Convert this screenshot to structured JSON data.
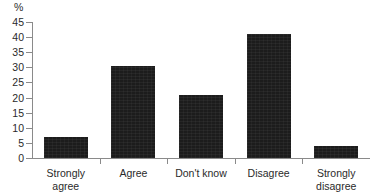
{
  "chart_data": {
    "type": "bar",
    "title": "",
    "xlabel": "",
    "ylabel": "%",
    "ylim": [
      0,
      45
    ],
    "ytick_step": 5,
    "grid": false,
    "legend": null,
    "bar_color": "#1c1c1c",
    "axis_color": "#8a8a8a",
    "categories": [
      "Strongly agree",
      "Agree",
      "Don't know",
      "Disagree",
      "Strongly disagree"
    ],
    "category_labels_wrapped": [
      "Strongly\nagree",
      "Agree",
      "Don't know",
      "Disagree",
      "Strongly\ndisagree"
    ],
    "values": [
      7,
      30.5,
      21,
      41,
      4
    ],
    "yticks": [
      0,
      5,
      10,
      15,
      20,
      25,
      30,
      35,
      40,
      45
    ],
    "ytick_labels": [
      "0",
      "5",
      "10",
      "15",
      "20",
      "25",
      "30",
      "35",
      "40",
      "45"
    ]
  }
}
